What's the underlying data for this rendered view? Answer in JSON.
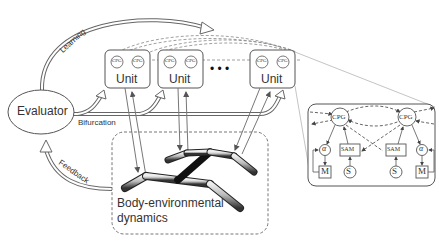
{
  "evaluator": {
    "label": "Evaluator"
  },
  "arrows": {
    "learning": "Learning",
    "bifurcation": "Bifurcation",
    "feedback": "Feedback"
  },
  "units": [
    {
      "label": "Unit",
      "cpg_left": "CPG",
      "cpg_right": "CPG"
    },
    {
      "label": "Unit",
      "cpg_left": "CPG",
      "cpg_right": "CPG"
    },
    {
      "label": "Unit",
      "cpg_left": "CPG",
      "cpg_right": "CPG"
    }
  ],
  "ellipsis": "• • •",
  "body": {
    "line1": "Body-environmental",
    "line2": "dynamics"
  },
  "inset": {
    "cpg_left": "CPG",
    "cpg_right": "CPG",
    "alpha_left": "α",
    "alpha_right": "α",
    "sam_left": "SAM",
    "sam_right": "SAM",
    "m_left": "M",
    "s_left": "S",
    "s_right": "S",
    "m_right": "M"
  }
}
